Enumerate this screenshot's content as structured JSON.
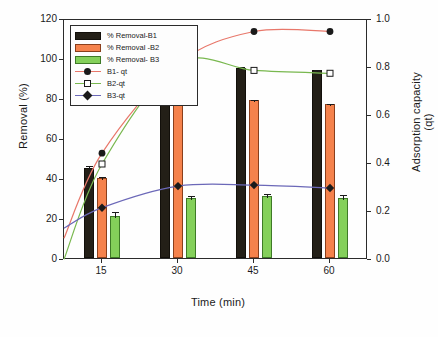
{
  "panel": {
    "tag": "(a)"
  },
  "axes": {
    "left": {
      "title": "Removal (%)",
      "ticks": [
        "0",
        "20",
        "40",
        "60",
        "80",
        "100",
        "120"
      ],
      "min": 0,
      "max": 120
    },
    "right": {
      "title": "Adsorption capacity (qt)",
      "ticks": [
        "0.0",
        "0.2",
        "0.4",
        "0.6",
        "0.8",
        "1.0"
      ],
      "min": 0,
      "max": 1.0
    },
    "x": {
      "title": "Time (min)",
      "ticks": [
        "15",
        "30",
        "45",
        "60"
      ]
    }
  },
  "legend": {
    "items": [
      {
        "label": "% Removal-B1",
        "kind": "bar",
        "color": "#231f17"
      },
      {
        "label": "% Removal -B2",
        "kind": "bar",
        "color": "#f5824c"
      },
      {
        "label": "% Removal- B3",
        "kind": "bar",
        "color": "#84d05a"
      },
      {
        "label": "B1- qt",
        "kind": "line",
        "color": "#e8776a",
        "marker": "circle"
      },
      {
        "label": "B2-qt",
        "kind": "line",
        "color": "#79b84f",
        "marker": "square"
      },
      {
        "label": "B3-qt",
        "kind": "line",
        "color": "#6b68b8",
        "marker": "diamond"
      }
    ]
  },
  "chart_data": {
    "type": "bar",
    "title": "(a)",
    "xlabel": "Time (min)",
    "ylabel": "Removal (%)",
    "y2label": "Adsorption capacity (qt)",
    "categories": [
      "15",
      "30",
      "45",
      "60"
    ],
    "ylim": [
      0,
      120
    ],
    "y2lim": [
      0,
      1.0
    ],
    "grid": false,
    "legend_position": "top-left",
    "series": [
      {
        "name": "% Removal-B1",
        "axis": "left",
        "type": "bar",
        "color": "#231f17",
        "values": [
          45,
          81,
          95,
          94
        ],
        "errors": [
          2.0,
          1.5,
          1.5,
          1.2
        ]
      },
      {
        "name": "% Removal -B2",
        "axis": "left",
        "type": "bar",
        "color": "#f5824c",
        "values": [
          40,
          81.5,
          79,
          77
        ],
        "errors": [
          1.5,
          1.2,
          1.0,
          1.2
        ]
      },
      {
        "name": "% Removal- B3",
        "axis": "left",
        "type": "bar",
        "color": "#84d05a",
        "values": [
          21,
          30,
          31,
          30
        ],
        "errors": [
          3.0,
          2.2,
          2.0,
          2.5
        ]
      },
      {
        "name": "B1- qt",
        "axis": "right",
        "type": "line",
        "color": "#e8776a",
        "marker": "circle",
        "values": [
          0.445,
          0.818,
          0.952,
          0.952
        ]
      },
      {
        "name": "B2-qt",
        "axis": "right",
        "type": "line",
        "color": "#79b84f",
        "marker": "square",
        "values": [
          0.4,
          0.818,
          0.79,
          0.778
        ]
      },
      {
        "name": "B3-qt",
        "axis": "right",
        "type": "line",
        "color": "#6b68b8",
        "marker": "diamond",
        "values": [
          0.218,
          0.308,
          0.312,
          0.3
        ]
      }
    ]
  }
}
